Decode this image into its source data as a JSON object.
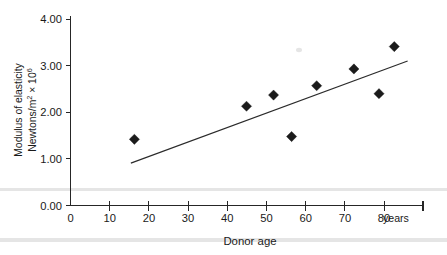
{
  "chart_data": {
    "type": "scatter",
    "title": "",
    "xlabel": "Donor age",
    "ylabel_line1": "Modulus of elasticity",
    "ylabel_line2_prefix": "Newtons/m",
    "ylabel_line2_sup1": "2",
    "ylabel_line2_mid": " × 10",
    "ylabel_line2_sup2": "6",
    "x_unit_label": "years",
    "xlim": [
      0,
      90
    ],
    "ylim": [
      0,
      4
    ],
    "xticks": [
      0,
      10,
      20,
      30,
      40,
      50,
      60,
      70,
      80
    ],
    "xtick_labels": [
      "0",
      "10",
      "20",
      "30",
      "40",
      "50",
      "60",
      "70",
      "80"
    ],
    "yticks": [
      0,
      1,
      2,
      3,
      4
    ],
    "ytick_labels": [
      "0.00",
      "1.00",
      "2.00",
      "3.00",
      "4.00"
    ],
    "grid": false,
    "legend": "none",
    "marker": "diamond",
    "points": [
      {
        "x": 16.3,
        "y": 1.42
      },
      {
        "x": 44.9,
        "y": 2.13
      },
      {
        "x": 51.8,
        "y": 2.37
      },
      {
        "x": 56.4,
        "y": 1.48
      },
      {
        "x": 62.8,
        "y": 2.57
      },
      {
        "x": 72.3,
        "y": 2.93
      },
      {
        "x": 78.7,
        "y": 2.4
      },
      {
        "x": 82.6,
        "y": 3.41
      }
    ],
    "trendline": {
      "x0": 15.4,
      "y0": 0.91,
      "x1": 86.0,
      "y1": 3.1
    }
  },
  "colors": {
    "marker": "#1b1b1b",
    "line": "#2b2b2b",
    "axis": "#262626",
    "text": "#1a1a1a",
    "background": "#ffffff"
  }
}
